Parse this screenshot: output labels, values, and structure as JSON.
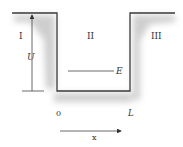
{
  "diagram": {
    "type": "finite-potential-well",
    "regions": [
      {
        "id": "region-1",
        "label": "I"
      },
      {
        "id": "region-2",
        "label": "II"
      },
      {
        "id": "region-3",
        "label": "III"
      }
    ],
    "well_depth_label": "U",
    "energy_label": "E",
    "left_edge_label": "0",
    "right_edge_label": "L",
    "axis_label": "x",
    "colors": {
      "line": "#3a3a3a",
      "shading": "#b8b8b8",
      "text": "#333333"
    }
  }
}
